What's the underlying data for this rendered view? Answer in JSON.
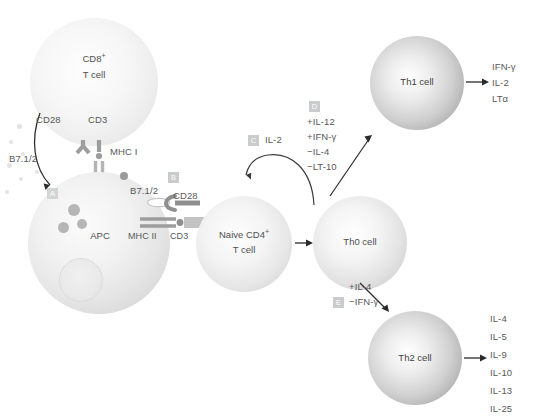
{
  "diagram": {
    "accent": "#c9cbcc",
    "cells": {
      "cd8": {
        "line1": "CD8",
        "sup": "+",
        "line2": "T cell"
      },
      "apc": {
        "label": "APC"
      },
      "naive": {
        "line1": "Naive CD4",
        "sup": "+",
        "line2": "T cell"
      },
      "th0": {
        "label": "Th0 cell"
      },
      "th1": {
        "label": "Th1 cell"
      },
      "th2": {
        "label": "Th2 cell"
      }
    },
    "receptors": {
      "cd8_cd28": "CD28",
      "cd8_cd3": "CD3",
      "apc_mhc1": "MHC I",
      "apc_b7_left": "B7.1/2",
      "apc_b7_right": "B7.1/2",
      "naive_cd28": "CD28",
      "apc_mhc2": "MHC II",
      "naive_cd3": "CD3"
    },
    "badges": {
      "a": "A",
      "b": "B",
      "c": "C",
      "d": "D",
      "e": "E"
    },
    "signals": {
      "c_label": "IL-2",
      "d_conditions": [
        "+IL-12",
        "+IFN-γ",
        "−IL-4",
        "−LT-10"
      ],
      "e_conditions_top": "+IL-4",
      "e_conditions_bottom": "−IFN-γ"
    },
    "outputs": {
      "th1": [
        "IFN-γ",
        "IL-2",
        "LTα"
      ],
      "th2": [
        "IL-4",
        "IL-5",
        "IL-9",
        "IL-10",
        "IL-13",
        "IL-25"
      ]
    }
  }
}
